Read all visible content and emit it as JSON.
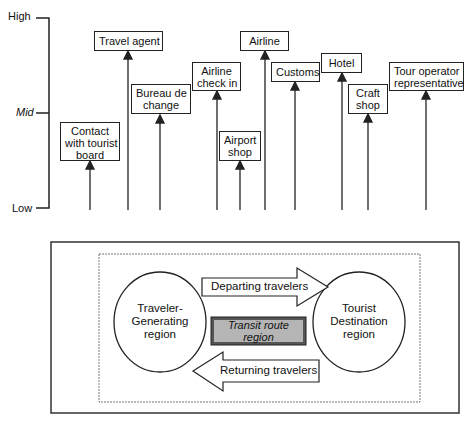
{
  "axis": {
    "high": "High",
    "mid": "Mid",
    "low": "Low"
  },
  "services": [
    {
      "label": "Contact with tourist board",
      "lines": [
        "Contact",
        "with tourist",
        "board"
      ],
      "level": "mid-low"
    },
    {
      "label": "Travel agent",
      "lines": [
        "Travel agent"
      ],
      "level": "high"
    },
    {
      "label": "Bureau de change",
      "lines": [
        "Bureau de",
        "change"
      ],
      "level": "mid-high"
    },
    {
      "label": "Airline check in",
      "lines": [
        "Airline",
        "check in"
      ],
      "level": "high-mid"
    },
    {
      "label": "Airport shop",
      "lines": [
        "Airport",
        "shop"
      ],
      "level": "mid-low"
    },
    {
      "label": "Airline",
      "lines": [
        "Airline"
      ],
      "level": "high"
    },
    {
      "label": "Customs",
      "lines": [
        "Customs"
      ],
      "level": "high-mid"
    },
    {
      "label": "Hotel",
      "lines": [
        "Hotel"
      ],
      "level": "high-mid"
    },
    {
      "label": "Craft shop",
      "lines": [
        "Craft",
        "shop"
      ],
      "level": "mid-high"
    },
    {
      "label": "Tour operator representative",
      "lines": [
        "Tour operator",
        "representative"
      ],
      "level": "high-mid"
    }
  ],
  "system": {
    "origin": [
      "Traveler-",
      "Generating",
      "region"
    ],
    "transit": [
      "Transit route",
      "region"
    ],
    "destination": [
      "Tourist",
      "Destination",
      "region"
    ],
    "departing": "Departing travelers",
    "returning": "Returning travelers",
    "transit_fill": "#b5b5b5"
  }
}
